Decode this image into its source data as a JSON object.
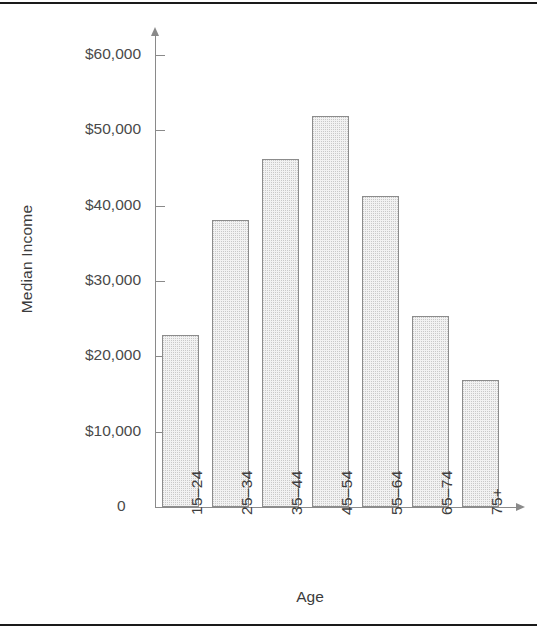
{
  "chart_data": {
    "type": "bar",
    "title": "",
    "xlabel": "Age",
    "ylabel": "Median Income",
    "categories": [
      "15–24",
      "25–34",
      "35–44",
      "45–54",
      "55–64",
      "65–74",
      "75+"
    ],
    "values": [
      22800,
      38100,
      46200,
      51900,
      41300,
      25400,
      16800
    ],
    "ylim": [
      0,
      63000
    ],
    "ytick_values": [
      0,
      10000,
      20000,
      30000,
      40000,
      50000,
      60000
    ],
    "ytick_labels": [
      "0",
      "$10,000",
      "$20,000",
      "$30,000",
      "$40,000",
      "$50,000",
      "$60,000"
    ],
    "grid": false,
    "legend": null,
    "bar_fill_color": "#f2f2f2",
    "bar_edge_color": "#8c8c8c",
    "axis_color": "#8a8a8a",
    "text_color": "#3c3c3c"
  },
  "figure": {
    "origin_label": "0"
  }
}
